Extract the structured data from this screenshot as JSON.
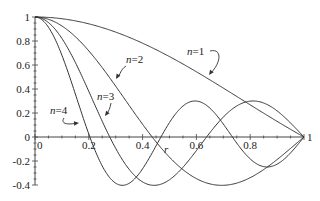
{
  "chart_data": {
    "type": "line",
    "title": "",
    "xlabel": "r",
    "ylabel": "",
    "xlim": [
      0,
      1
    ],
    "ylim": [
      -0.4,
      1
    ],
    "grid": false,
    "x_ticks": [
      "0",
      "0.2",
      "0.4",
      "0.6",
      "0.8",
      "1"
    ],
    "y_ticks": [
      "1",
      "0.8",
      "0.6",
      "0.4",
      "0.2",
      "0",
      "-0.2",
      "-0.4"
    ],
    "series": [
      {
        "name": "n=1",
        "zero_scale": 2.4048
      },
      {
        "name": "n=2",
        "zero_scale": 5.5201
      },
      {
        "name": "n=3",
        "zero_scale": 8.6537
      },
      {
        "name": "n=4",
        "zero_scale": 11.7915
      }
    ],
    "annotations": [
      {
        "text": "n=1",
        "x": 0.72,
        "y": 0.55
      },
      {
        "text": "n=2",
        "x": 0.36,
        "y": 0.6
      },
      {
        "text": "n=3",
        "x": 0.27,
        "y": 0.32
      },
      {
        "text": "n=4",
        "x": 0.07,
        "y": 0.22
      }
    ]
  },
  "axis": {
    "xlabel": "r"
  },
  "labels": {
    "n1": "n=1",
    "n2": "n=2",
    "n3": "n=3",
    "n4": "n=4"
  }
}
